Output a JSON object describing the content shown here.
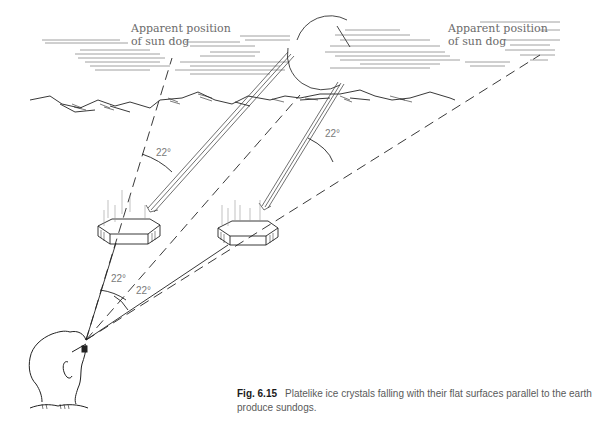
{
  "figure": {
    "labels": {
      "left_apparent_position": [
        "Apparent position",
        "of sun dog"
      ],
      "right_apparent_position": [
        "Apparent position",
        "of sun dog"
      ]
    },
    "angles": [
      {
        "id": "upper-left",
        "text": "22°"
      },
      {
        "id": "upper-right",
        "text": "22°"
      },
      {
        "id": "eye-upper",
        "text": "22°"
      },
      {
        "id": "eye-lower",
        "text": "22°"
      }
    ],
    "elements": [
      "sun",
      "clouds",
      "horizon-mountains",
      "ice-crystal-left",
      "ice-crystal-right",
      "observer-head",
      "sun-rays",
      "sight-lines"
    ],
    "colors": {
      "line": "#222222",
      "label": "#6b6b6b",
      "caption": "#5a5a5a"
    }
  },
  "caption": {
    "figure_number": "Fig. 6.15",
    "text": "Platelike ice crystals falling with their flat surfaces parallel to the earth produce sundogs."
  }
}
